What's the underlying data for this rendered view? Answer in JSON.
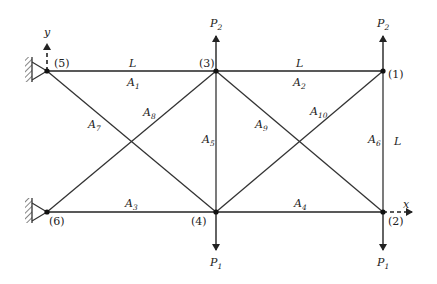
{
  "diagram": {
    "type": "ten-bar planar truss",
    "axes": {
      "x_label": "x",
      "y_label": "y"
    },
    "length_labels": [
      {
        "text": "L",
        "position": "top span 5-3"
      },
      {
        "text": "L",
        "position": "top span 3-1"
      },
      {
        "text": "L",
        "position": "vertical span 1-2"
      }
    ],
    "nodes": [
      {
        "id": "1",
        "label": "(1)",
        "x": 383,
        "y": 71
      },
      {
        "id": "2",
        "label": "(2)",
        "x": 383,
        "y": 212
      },
      {
        "id": "3",
        "label": "(3)",
        "x": 216,
        "y": 71
      },
      {
        "id": "4",
        "label": "(4)",
        "x": 216,
        "y": 212
      },
      {
        "id": "5",
        "label": "(5)",
        "x": 47,
        "y": 71,
        "support": "pin-wall"
      },
      {
        "id": "6",
        "label": "(6)",
        "x": 47,
        "y": 212,
        "support": "pin-wall"
      }
    ],
    "members": [
      {
        "label": "A",
        "sub": "1",
        "from": "5",
        "to": "3"
      },
      {
        "label": "A",
        "sub": "2",
        "from": "3",
        "to": "1"
      },
      {
        "label": "A",
        "sub": "3",
        "from": "6",
        "to": "4"
      },
      {
        "label": "A",
        "sub": "4",
        "from": "4",
        "to": "2"
      },
      {
        "label": "A",
        "sub": "5",
        "from": "3",
        "to": "4"
      },
      {
        "label": "A",
        "sub": "6",
        "from": "1",
        "to": "2"
      },
      {
        "label": "A",
        "sub": "7",
        "from": "5",
        "to": "4"
      },
      {
        "label": "A",
        "sub": "8",
        "from": "6",
        "to": "3"
      },
      {
        "label": "A",
        "sub": "9",
        "from": "3",
        "to": "2"
      },
      {
        "label": "A",
        "sub": "10",
        "from": "4",
        "to": "1"
      }
    ],
    "loads": [
      {
        "label": "P",
        "sub": "2",
        "node": "3",
        "direction": "up"
      },
      {
        "label": "P",
        "sub": "2",
        "node": "1",
        "direction": "up"
      },
      {
        "label": "P",
        "sub": "1",
        "node": "4",
        "direction": "down"
      },
      {
        "label": "P",
        "sub": "1",
        "node": "2",
        "direction": "down"
      }
    ]
  }
}
